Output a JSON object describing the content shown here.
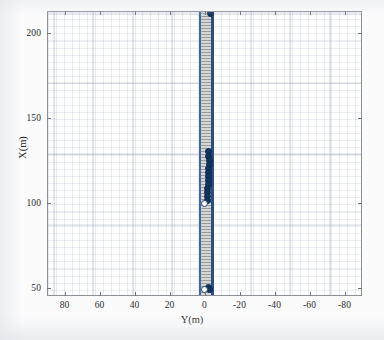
{
  "chart_data": {
    "type": "scatter",
    "title": "",
    "xlabel": "Y(m)",
    "ylabel": "X(m)",
    "xlim": [
      90,
      -90
    ],
    "ylim": [
      45,
      213
    ],
    "x_ticks": [
      "80",
      "60",
      "40",
      "20",
      "0",
      "-20",
      "-40",
      "-60",
      "-80"
    ],
    "x_tick_values": [
      80,
      60,
      40,
      20,
      0,
      -20,
      -40,
      -60,
      -80
    ],
    "y_ticks": [
      "50",
      "100",
      "150",
      "200"
    ],
    "y_tick_values": [
      50,
      100,
      150,
      200
    ],
    "x_axis_reversed": true,
    "grid": "minor-and-major",
    "legend": "none",
    "series": [
      {
        "name": "road-corridor",
        "type": "area",
        "fill": "hatched-gray",
        "y_left": 3.0,
        "y_right": -3.0,
        "x_range": [
          45,
          213
        ]
      },
      {
        "name": "vehicle-trajectory",
        "type": "line",
        "color": "#2d4f80",
        "points": [
          {
            "y": -2.6,
            "x": 45
          },
          {
            "y": -2.6,
            "x": 213
          }
        ]
      },
      {
        "name": "waypoint-markers",
        "type": "scatter",
        "marker": "filled-circle",
        "color": "#12355f",
        "points": [
          {
            "y": -2.6,
            "x": 212.0
          },
          {
            "y": -1.8,
            "x": 130.5
          },
          {
            "y": -1.9,
            "x": 128.0
          },
          {
            "y": -2.0,
            "x": 125.6
          },
          {
            "y": -2.0,
            "x": 123.2
          },
          {
            "y": -1.9,
            "x": 120.8
          },
          {
            "y": -1.8,
            "x": 118.4
          },
          {
            "y": -1.7,
            "x": 116.0
          },
          {
            "y": -1.6,
            "x": 113.6
          },
          {
            "y": -1.5,
            "x": 111.2
          },
          {
            "y": -1.4,
            "x": 108.8
          },
          {
            "y": -1.3,
            "x": 106.4
          },
          {
            "y": -1.2,
            "x": 104.0
          },
          {
            "y": -1.1,
            "x": 101.6
          },
          {
            "y": -1.5,
            "x": 50.5
          },
          {
            "y": -2.2,
            "x": 49.5
          }
        ]
      },
      {
        "name": "start-markers-open",
        "type": "scatter",
        "marker": "open-circle",
        "color": "#1d3f6d",
        "points": [
          {
            "y": 0.4,
            "x": 100.0
          },
          {
            "y": 0.4,
            "x": 49.5
          }
        ]
      }
    ]
  },
  "figure": {
    "axis": {
      "x_title": "Y(m)",
      "y_title": "X(m)"
    },
    "colors": {
      "axis_line": "#8c9099",
      "grid_minor": "#b4becd",
      "grid_major": "#96a2b6",
      "road_fill": "#c9c9c9",
      "road_edge": "#41699e",
      "trajectory": "#2d4f80",
      "marker_fill": "#12355f",
      "background": "#ffffff"
    }
  }
}
